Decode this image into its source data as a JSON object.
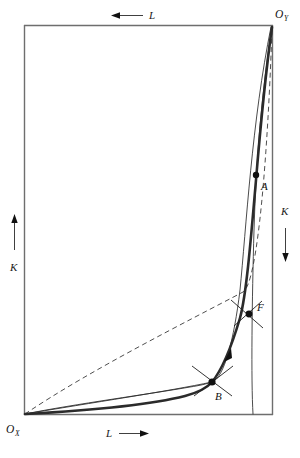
{
  "figure": {
    "type": "edgeworth-box-diagram",
    "title": "",
    "background_color": "#ffffff",
    "frame": {
      "x_left": 24,
      "y_top": 25,
      "x_right": 273,
      "y_bottom": 415,
      "stroke_color": "#6e6e6e"
    },
    "origins": {
      "ox": {
        "label": "O",
        "subscript": "X",
        "x": 24,
        "y": 415,
        "text_x": 6,
        "text_y": 432
      },
      "oy": {
        "label": "O",
        "subscript": "Y",
        "x": 273,
        "y": 25,
        "text_x": 274,
        "text_y": 17
      }
    },
    "axis_labels": [
      {
        "name": "top-L",
        "text": "L",
        "arrow": "left",
        "x": 150,
        "y": 19
      },
      {
        "name": "bottom-L",
        "text": "L",
        "arrow": "right",
        "x": 110,
        "y": 436
      },
      {
        "name": "left-K",
        "text": "K",
        "arrow": "up",
        "x": 12,
        "y": 250
      },
      {
        "name": "right-K",
        "text": "K",
        "arrow": "down",
        "x": 284,
        "y": 215
      }
    ],
    "points": [
      {
        "name": "A",
        "label": "A",
        "x": 256,
        "y": 175,
        "label_x": 261,
        "label_y": 189,
        "marker": "dot",
        "tangency_ticks": false
      },
      {
        "name": "F",
        "label": "F",
        "x": 249,
        "y": 314,
        "label_x": 256,
        "label_y": 310,
        "marker": "dot",
        "tangency_ticks": true
      },
      {
        "name": "B",
        "label": "B",
        "x": 212,
        "y": 382,
        "label_x": 215,
        "label_y": 399,
        "marker": "dot",
        "tangency_ticks": true
      }
    ],
    "curves": {
      "contract_curve": {
        "name": "contract-curve",
        "style": "thick-solid",
        "description": "Thick contract curve from O_X through B and F to O_Y"
      },
      "isoquant_through_B": {
        "name": "isoquant-through-B",
        "style": "thin-solid",
        "description": "Thin isoquant passing through B, concave from O_X"
      },
      "isoquant_through_F": {
        "name": "isoquant-through-F",
        "style": "thin-solid",
        "description": "Thin isoquant from O_X rising steeply to O_Y through F"
      },
      "isoquant_through_A": {
        "name": "isoquant-through-A",
        "style": "thin-solid",
        "description": "Thin isoquant near right edge passing through A"
      },
      "diagonal_dashed": {
        "name": "diagonal-dashed-ray",
        "style": "dashed",
        "description": "Dashed ray from O_X to O_Y"
      }
    },
    "direction_arrow": {
      "name": "contract-curve-direction-arrow",
      "x": 228,
      "y": 355,
      "description": "Arrowhead on contract curve between B and F indicating direction toward O_Y"
    },
    "colors": {
      "ink": "#1a1a1a",
      "frame": "#6e6e6e",
      "curve": "#2b2b2b"
    }
  }
}
